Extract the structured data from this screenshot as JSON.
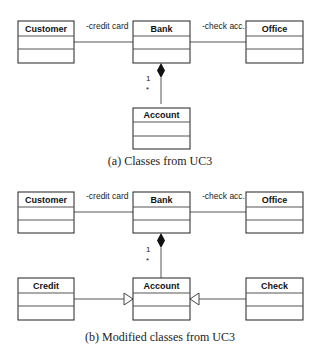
{
  "figure_a": {
    "caption": "(a)  Classes from UC3",
    "classes": {
      "customer": "Customer",
      "bank": "Bank",
      "office": "Office",
      "account": "Account"
    },
    "associations": {
      "customer_bank": "-credit card",
      "bank_office": "-check acc."
    },
    "composition": {
      "multiplicity_bank": "1",
      "multiplicity_account": "*"
    }
  },
  "figure_b": {
    "caption": "(b)  Modified classes from UC3",
    "classes": {
      "customer": "Customer",
      "bank": "Bank",
      "office": "Office",
      "account": "Account",
      "credit": "Credit",
      "check": "Check"
    },
    "associations": {
      "customer_bank": "-credit card",
      "bank_office": "-check acc."
    },
    "composition": {
      "multiplicity_bank": "1",
      "multiplicity_account": "*"
    },
    "generalizations": [
      "Credit -> Account",
      "Check -> Account"
    ]
  }
}
